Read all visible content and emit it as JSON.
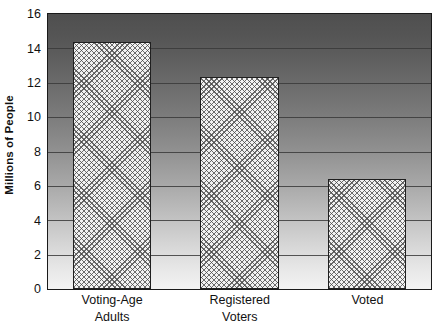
{
  "chart_data": {
    "type": "bar",
    "title": "",
    "subtitle": "",
    "xlabel": "",
    "ylabel": "Millions of People",
    "categories": [
      "Voting-Age Adults",
      "Registered Voters",
      "Voted"
    ],
    "category_lines": [
      [
        "Voting-Age",
        "Adults"
      ],
      [
        "Registered",
        "Voters"
      ],
      [
        "Voted",
        ""
      ]
    ],
    "values": [
      14.35,
      12.35,
      6.4
    ],
    "ylim": [
      0,
      16
    ],
    "ytick_labels": [
      "0",
      "2",
      "4",
      "6",
      "8",
      "10",
      "12",
      "14",
      "16"
    ],
    "ytick_values": [
      0,
      2,
      4,
      6,
      8,
      10,
      12,
      14,
      16
    ],
    "grid": true,
    "legend": false,
    "legend_position": "none",
    "bar_pattern": "crosshatch",
    "colors": {
      "bar_fill": "#f2f2f2",
      "bar_hatch": "#464646",
      "bar_border": "#1f1f1f",
      "axis": "#1a1a1a",
      "gridline": "#3a3a3a",
      "text": "#111111",
      "plot_bg_top": "#4f4f4f",
      "plot_bg_bottom": "#f3f3f3"
    },
    "annotations": []
  }
}
